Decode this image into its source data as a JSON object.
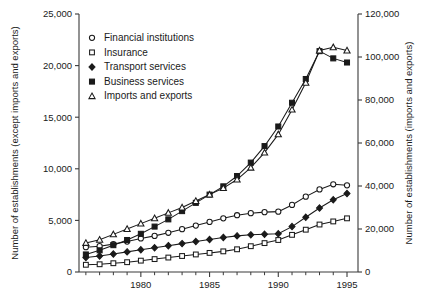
{
  "chart_data": {
    "type": "line",
    "title": "",
    "xlabel": "",
    "ylabel": "Number of establishments (except imports and exports)",
    "ylabel_right": "Number of establishments (imports and exports)",
    "grid": false,
    "legend_position": "top-left-inside",
    "x": [
      1976,
      1977,
      1978,
      1979,
      1980,
      1981,
      1982,
      1983,
      1984,
      1985,
      1986,
      1987,
      1988,
      1989,
      1990,
      1991,
      1992,
      1993,
      1994,
      1995
    ],
    "xlim": [
      1975.5,
      1995.8
    ],
    "xticks": [
      1976,
      1977,
      1978,
      1979,
      1980,
      1981,
      1982,
      1983,
      1984,
      1985,
      1986,
      1987,
      1988,
      1989,
      1990,
      1991,
      1992,
      1993,
      1994,
      1995
    ],
    "xticklabels": [
      "",
      "",
      "",
      "",
      "1980",
      "",
      "",
      "",
      "",
      "1985",
      "",
      "",
      "",
      "",
      "1990",
      "",
      "",
      "",
      "",
      "1995"
    ],
    "ylim": [
      0,
      25000
    ],
    "yticks": [
      0,
      5000,
      10000,
      15000,
      20000,
      25000
    ],
    "yticklabels": [
      "0",
      "5,000",
      "10,000",
      "15,000",
      "20,000",
      "25,000"
    ],
    "ylim_right": [
      0,
      120000
    ],
    "yticks_right": [
      0,
      20000,
      40000,
      60000,
      80000,
      100000,
      120000
    ],
    "yticklabels_right": [
      "0",
      "20,000",
      "40,000",
      "60,000",
      "80,000",
      "100,000",
      "120,000"
    ],
    "series": [
      {
        "name": "Financial institutions",
        "marker": "open-circle",
        "axis": "left",
        "values": [
          2400,
          2500,
          2700,
          2950,
          3250,
          3500,
          3800,
          4150,
          4500,
          4850,
          5200,
          5500,
          5700,
          5800,
          5850,
          6500,
          7300,
          8000,
          8500,
          8400
        ]
      },
      {
        "name": "Insurance",
        "marker": "open-square",
        "axis": "left",
        "values": [
          700,
          750,
          850,
          950,
          1100,
          1250,
          1400,
          1550,
          1700,
          1850,
          2000,
          2200,
          2500,
          2800,
          3100,
          3600,
          4100,
          4600,
          4900,
          5200
        ]
      },
      {
        "name": "Transport services",
        "marker": "filled-diamond",
        "axis": "left",
        "values": [
          1400,
          1550,
          1750,
          1950,
          2150,
          2350,
          2550,
          2750,
          2950,
          3150,
          3350,
          3500,
          3600,
          3650,
          3700,
          4400,
          5300,
          6200,
          7000,
          7600
        ]
      },
      {
        "name": "Business services",
        "marker": "filled-square",
        "axis": "left",
        "values": [
          1700,
          2100,
          2600,
          3100,
          3700,
          4400,
          5100,
          5900,
          6700,
          7500,
          8300,
          9300,
          10600,
          12200,
          14100,
          16400,
          18700,
          21400,
          20700,
          20300
        ]
      },
      {
        "name": "Imports and exports",
        "marker": "open-triangle",
        "axis": "right",
        "values": [
          13500,
          15000,
          17500,
          20000,
          22500,
          25000,
          27500,
          30000,
          33000,
          36000,
          39000,
          43000,
          48500,
          55500,
          64000,
          75500,
          88000,
          103000,
          104500,
          103000
        ]
      }
    ]
  },
  "legend": {
    "items": [
      {
        "label": "Financial institutions",
        "marker": "open-circle"
      },
      {
        "label": "Insurance",
        "marker": "open-square"
      },
      {
        "label": "Transport services",
        "marker": "filled-diamond"
      },
      {
        "label": "Business services",
        "marker": "filled-square"
      },
      {
        "label": "Imports and exports",
        "marker": "open-triangle"
      }
    ]
  },
  "colors": {
    "ink": "#1a1a1a",
    "axis": "#3a3a3a",
    "background": "#ffffff"
  }
}
